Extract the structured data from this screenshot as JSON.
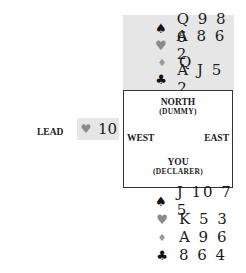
{
  "north": {
    "hand": [
      {
        "suit": "spades",
        "symbol": "♠",
        "cards": "Q 9 8 6"
      },
      {
        "suit": "hearts",
        "symbol": "♥",
        "cards": "A 8 6 2"
      },
      {
        "suit": "diamonds",
        "symbol": "♦",
        "cards": "Q"
      },
      {
        "suit": "clubs",
        "symbol": "♣",
        "cards": "A J 5 2"
      }
    ]
  },
  "table": {
    "north_label": "NORTH",
    "north_sub": "(DUMMY)",
    "west_label": "WEST",
    "east_label": "EAST",
    "south_label": "YOU",
    "south_sub": "(DECLARER)"
  },
  "lead": {
    "label": "LEAD",
    "suit_symbol": "♥",
    "card": "10"
  },
  "south": {
    "hand": [
      {
        "suit": "spades",
        "symbol": "♠",
        "cards": "J 10 7 5"
      },
      {
        "suit": "hearts",
        "symbol": "♥",
        "cards": "K 5 3"
      },
      {
        "suit": "diamonds",
        "symbol": "♦",
        "cards": "A 9 6"
      },
      {
        "suit": "clubs",
        "symbol": "♣",
        "cards": "8 6 4"
      }
    ]
  },
  "colors": {
    "hand_background": "#e6e6e6",
    "red_suit": "#8a8a8a",
    "black_suit": "#111111"
  }
}
